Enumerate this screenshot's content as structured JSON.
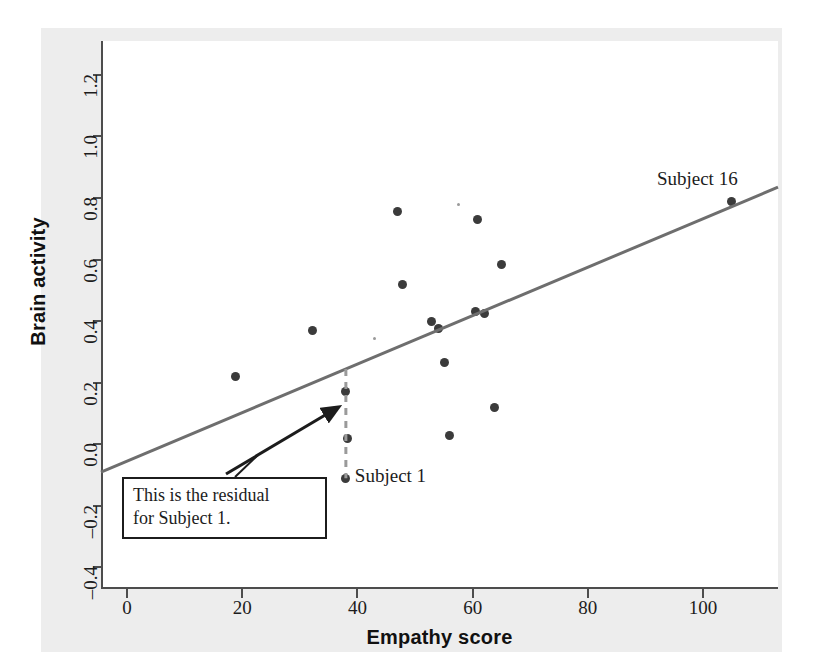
{
  "chart_data": {
    "type": "scatter",
    "title": "",
    "xlabel": "Empathy score",
    "ylabel": "Brain activity",
    "xlim": [
      -4.5,
      113
    ],
    "ylim": [
      -0.47,
      1.31
    ],
    "xticks": [
      0,
      20,
      40,
      60,
      80,
      100
    ],
    "xtick_labels": [
      "0",
      "20",
      "40",
      "60",
      "80",
      "100"
    ],
    "yticks": [
      -0.4,
      -0.2,
      0.0,
      0.2,
      0.4,
      0.6,
      0.8,
      1.0,
      1.2
    ],
    "ytick_labels": [
      "-0.4",
      "-0.2",
      "0.0",
      "0.2",
      "0.4",
      "0.6",
      "0.8",
      "1.0",
      "1.2"
    ],
    "grid": false,
    "legend": "none",
    "point_color": "#3b3b3b",
    "line_color": "#6e6e6e",
    "points": [
      {
        "x": 18.8,
        "y": 0.22
      },
      {
        "x": 32.2,
        "y": 0.37
      },
      {
        "x": 38.0,
        "y": 0.17
      },
      {
        "x": 38.3,
        "y": 0.02
      },
      {
        "x": 38.0,
        "y": -0.11,
        "label": "Subject 1"
      },
      {
        "x": 47.0,
        "y": 0.755
      },
      {
        "x": 47.8,
        "y": 0.52
      },
      {
        "x": 52.8,
        "y": 0.4
      },
      {
        "x": 54.0,
        "y": 0.375
      },
      {
        "x": 55.2,
        "y": 0.265
      },
      {
        "x": 56.0,
        "y": 0.03
      },
      {
        "x": 60.8,
        "y": 0.73
      },
      {
        "x": 60.5,
        "y": 0.43
      },
      {
        "x": 62.0,
        "y": 0.425
      },
      {
        "x": 63.8,
        "y": 0.12
      },
      {
        "x": 65.0,
        "y": 0.585
      },
      {
        "x": 105.0,
        "y": 0.79,
        "label": "Subject 16"
      }
    ],
    "faint_points": [
      {
        "x": 57.5,
        "y": 0.78
      },
      {
        "x": 43.0,
        "y": 0.345
      }
    ],
    "regression_line": {
      "x_start": -4.5,
      "y_start": -0.09,
      "x_end": 113.0,
      "y_end": 0.835,
      "color": "#6e6e6e"
    },
    "residual": {
      "subject": "Subject 1",
      "x": 38.0,
      "y_point": -0.11,
      "y_fitted": 0.245,
      "style": "dashed",
      "color": "#9a9a9a"
    },
    "annotation": {
      "line1": "This is the residual",
      "line2": "for Subject 1.",
      "arrow_from_x": 226,
      "arrow_from_y": 474,
      "arrow_to_x": 337,
      "arrow_to_y": 408
    }
  },
  "labels": {
    "subject1": "Subject 1",
    "subject16": "Subject 16"
  }
}
